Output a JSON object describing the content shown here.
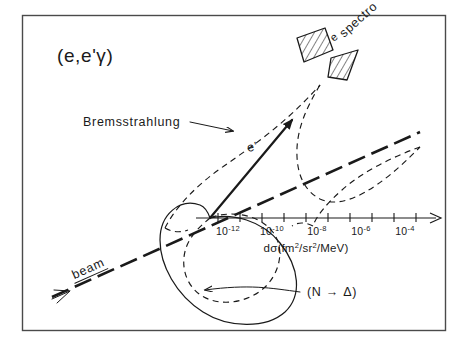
{
  "figure": {
    "title": "(e,e'γ)",
    "background_color": "#ffffff",
    "ink_color": "#1a1a1a",
    "frame_color": "#4a4a4a"
  },
  "labels": {
    "reaction_title": "(e,e'γ)",
    "bremsstrahlung": "Bremsstrahlung",
    "scattered_electron": "e'",
    "beam": "beam",
    "resonance": "(N → Δ)",
    "spectrometer_electron": "e",
    "spectrometer": "spectro"
  },
  "axis": {
    "label_prefix": "dσ (fm",
    "label_full": "dσ(fm2/sr2/MeV)",
    "label_parts": {
      "d_sigma": "dσ(fm",
      "exp1": "2",
      "sep1": "/sr",
      "exp2": "2",
      "sep2": "/MeV)"
    },
    "direction": "right",
    "tick_labels": [
      "10-12",
      "10-10",
      "10-8",
      "10-6",
      "10-4"
    ],
    "tick_mantissa": "10",
    "tick_exponents": [
      "-12",
      "-10",
      "-8",
      "-6",
      "-4"
    ],
    "tick_count_total": 10,
    "origin_x": 210,
    "origin_y": 218,
    "end_x": 440
  },
  "curves": [
    {
      "name": "bremsstrahlung-lobe",
      "style": "dashed",
      "description": "narrow cusped lobe extending up-right to spectrometer"
    },
    {
      "name": "delta-resonance-lobe",
      "style": "solid",
      "description": "large circular lobe centered below-left of origin"
    },
    {
      "name": "beam-line",
      "style": "long-dash",
      "description": "straight beam trajectory from lower-left to upper-right"
    }
  ],
  "spectrometer": {
    "segments": 2,
    "fill": "hatched",
    "rotation_deg": -45
  }
}
